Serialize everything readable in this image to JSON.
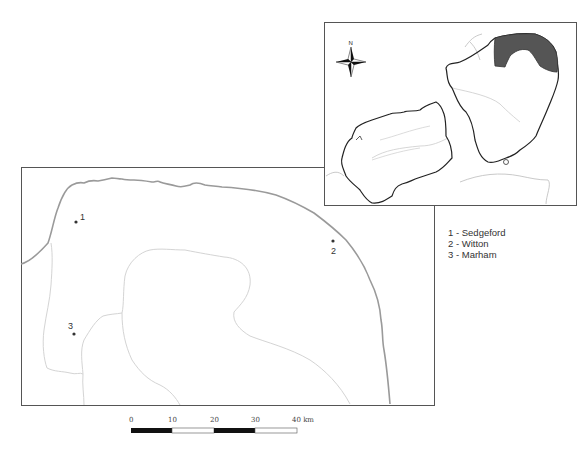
{
  "main_map": {
    "sites": [
      {
        "number": "1",
        "name": "Sedgeford"
      },
      {
        "number": "2",
        "name": "Witton"
      },
      {
        "number": "3",
        "name": "Marham"
      }
    ]
  },
  "legend": {
    "items": [
      "1 - Sedgeford",
      "2 - Witton",
      "3 - Marham"
    ]
  },
  "scale_bar": {
    "ticks": [
      "0",
      "10",
      "20",
      "30",
      "40 km"
    ]
  },
  "inset_map": {
    "north_arrow_label": "N",
    "highlight_color": "#555555"
  },
  "colors": {
    "coastline": "#9a9a9a",
    "boundary": "#d4d4d4",
    "frame": "#555555",
    "region_outline": "#222222"
  }
}
